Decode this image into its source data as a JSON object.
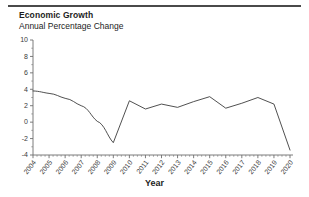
{
  "chart_data": {
    "type": "line",
    "title": "Economic Growth",
    "subtitle": "Annual Percentage Change",
    "xlabel": "Year",
    "ylabel": "",
    "categories": [
      "2004",
      "2005",
      "2006",
      "2007",
      "2008",
      "2009",
      "2010",
      "2011",
      "2012",
      "2013",
      "2014",
      "2015",
      "2016",
      "2017",
      "2018",
      "2019",
      "2020"
    ],
    "values": [
      3.8,
      3.5,
      2.9,
      2.0,
      0.1,
      -2.5,
      2.6,
      1.6,
      2.2,
      1.8,
      2.5,
      3.1,
      1.7,
      2.3,
      3.0,
      2.2,
      -3.4
    ],
    "xlim": [
      2004,
      2020
    ],
    "ylim": [
      -4,
      10
    ],
    "ytick_labels": [
      "10",
      "8",
      "6",
      "4",
      "2",
      "0",
      "-2",
      "-4"
    ],
    "ytick_values": [
      10,
      8,
      6,
      4,
      2,
      0,
      -2,
      -4
    ],
    "xtick_labels": [
      "2004",
      "2005",
      "2006",
      "2007",
      "2008",
      "2009",
      "2010",
      "2011",
      "2012",
      "2013",
      "2014",
      "2015",
      "2016",
      "2017",
      "2018",
      "2019",
      "2020"
    ],
    "grid": false,
    "legend": false,
    "series_color": "#3c3c3c",
    "axis_color": "#6d6d6d",
    "minor_ticks_per_interval": 4
  }
}
